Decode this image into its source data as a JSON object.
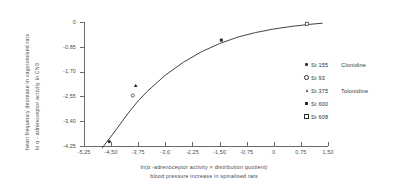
{
  "chart_data": {
    "type": "scatter",
    "title": "",
    "xlabel": "ln(α - adrenoceptor activity × distribution quotient)  /  blood pressure increase in spinalised rats",
    "xlabel_line1": "ln(α -adrenoceptor activity × distribution quotient)",
    "xlabel_line2": "blood pressure increase in spinalised rats",
    "ylabel_line1": "heart frequency decrease in vagotomised rats",
    "ylabel_line2": "ln α - adrenoceptor activity in CNS",
    "xlim": [
      -5.25,
      1.5
    ],
    "ylim": [
      -4.25,
      0
    ],
    "grid": false,
    "legend_position": "right",
    "xticks": [
      -5.25,
      -4.5,
      -3.75,
      -3.0,
      -2.25,
      -1.5,
      -0.75,
      0,
      0.75,
      1.5
    ],
    "xticklabels": [
      "-5,25",
      "-4,50",
      "-3,75",
      "-3,0",
      "-2,25",
      "-1,50",
      "-0,75",
      "0",
      "0,75",
      "1,50"
    ],
    "yticks": [
      0,
      -0.85,
      -1.7,
      -2.55,
      -3.4,
      -4.25
    ],
    "yticklabels": [
      "0",
      "-0,85",
      "-1,70",
      "-2,55",
      "-3,40",
      "-4,25"
    ],
    "series": [
      {
        "name": "St 155  Clonidine",
        "code": "St 155",
        "compound": "Clonidine",
        "marker": "filled-circle",
        "points": [
          [
            -4.55,
            -4.1
          ]
        ]
      },
      {
        "name": "St  93",
        "code": "St  93",
        "compound": "",
        "marker": "open-circle",
        "points": [
          [
            -3.9,
            -2.52
          ]
        ]
      },
      {
        "name": "St 375  Tolonidine",
        "code": "St 375",
        "compound": "Tolonidine",
        "marker": "triangle",
        "points": [
          [
            -3.82,
            -2.18
          ]
        ]
      },
      {
        "name": "St 600",
        "code": "St 600",
        "compound": "",
        "marker": "square",
        "points": [
          [
            -1.45,
            -0.62
          ]
        ]
      },
      {
        "name": "St 608",
        "code": "St 608",
        "compound": "",
        "marker": "open-square",
        "points": [
          [
            0.92,
            -0.06
          ]
        ]
      }
    ],
    "fit_curve": {
      "description": "saturating logarithmic fit through all points",
      "x": [
        -4.75,
        -4.5,
        -4.25,
        -4.0,
        -3.75,
        -3.5,
        -3.0,
        -2.5,
        -2.0,
        -1.5,
        -1.0,
        -0.5,
        0.0,
        0.5,
        1.0,
        1.35
      ],
      "y": [
        -4.32,
        -3.92,
        -3.5,
        -3.08,
        -2.7,
        -2.38,
        -1.82,
        -1.38,
        -1.02,
        -0.74,
        -0.52,
        -0.36,
        -0.24,
        -0.15,
        -0.08,
        -0.04
      ]
    }
  },
  "legend": {
    "items": [
      {
        "code": "St 155",
        "compound": "Clonidine",
        "marker": "filled-circle"
      },
      {
        "code": "St  93",
        "compound": "",
        "marker": "open-circle"
      },
      {
        "code": "St 375",
        "compound": "Tolonidine",
        "marker": "triangle"
      },
      {
        "code": "St 600",
        "compound": "",
        "marker": "square"
      },
      {
        "code": "St 608",
        "compound": "",
        "marker": "open-square"
      }
    ]
  }
}
